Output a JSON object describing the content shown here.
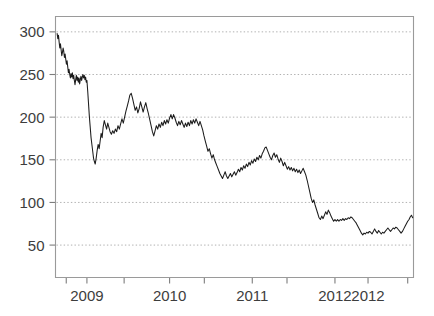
{
  "chart_data": {
    "type": "line",
    "title": "",
    "subtitle": "",
    "xlabel": "",
    "ylabel": "",
    "xlim": [
      2008.62,
      2012.95
    ],
    "ylim": [
      12,
      318
    ],
    "grid": true,
    "grid_axis": "y",
    "legend": null,
    "legend_position": "none",
    "line_color": "#1c1c1c",
    "grid_color": "#a8a8a8",
    "axis_color": "#8e8e8e",
    "label_color": "#3d3d3d",
    "background_color": "#ffffff",
    "ytick_values": [
      50,
      100,
      150,
      200,
      250,
      300
    ],
    "ytick_labels": [
      "50",
      "100",
      "150",
      "200",
      "250",
      "300"
    ],
    "xtick_values": [
      2008.75,
      2009.0,
      2009.45,
      2010.0,
      2010.42,
      2011.0,
      2011.42,
      2012.0,
      2012.4,
      2012.88
    ],
    "xtick_labeled": [
      2009.0,
      2010.0,
      2011.0,
      2012.0,
      2012.4
    ],
    "xtick_labels": [
      "2009",
      "2010",
      "2011",
      "2012",
      "2012"
    ],
    "series": [
      {
        "name": "price",
        "color": "#1c1c1c",
        "x": [
          2008.64,
          2008.648,
          2008.656,
          2008.664,
          2008.672,
          2008.68,
          2008.688,
          2008.696,
          2008.704,
          2008.712,
          2008.72,
          2008.728,
          2008.736,
          2008.744,
          2008.752,
          2008.76,
          2008.768,
          2008.776,
          2008.784,
          2008.792,
          2008.8,
          2008.808,
          2008.816,
          2008.824,
          2008.832,
          2008.84,
          2008.848,
          2008.856,
          2008.864,
          2008.872,
          2008.88,
          2008.888,
          2008.896,
          2008.904,
          2008.912,
          2008.92,
          2008.928,
          2008.936,
          2008.944,
          2008.952,
          2008.96,
          2008.968,
          2008.976,
          2008.984,
          2008.992,
          2009.0,
          2009.01,
          2009.02,
          2009.03,
          2009.04,
          2009.05,
          2009.06,
          2009.07,
          2009.08,
          2009.09,
          2009.1,
          2009.112,
          2009.124,
          2009.136,
          2009.148,
          2009.16,
          2009.172,
          2009.184,
          2009.196,
          2009.21,
          2009.224,
          2009.238,
          2009.252,
          2009.266,
          2009.28,
          2009.296,
          2009.312,
          2009.328,
          2009.344,
          2009.36,
          2009.376,
          2009.392,
          2009.408,
          2009.424,
          2009.44,
          2009.456,
          2009.472,
          2009.488,
          2009.504,
          2009.52,
          2009.536,
          2009.552,
          2009.568,
          2009.584,
          2009.6,
          2009.616,
          2009.632,
          2009.648,
          2009.664,
          2009.68,
          2009.696,
          2009.712,
          2009.728,
          2009.744,
          2009.76,
          2009.776,
          2009.792,
          2009.808,
          2009.824,
          2009.84,
          2009.856,
          2009.872,
          2009.888,
          2009.904,
          2009.92,
          2009.936,
          2009.952,
          2009.968,
          2009.984,
          2010.0,
          2010.016,
          2010.032,
          2010.048,
          2010.064,
          2010.08,
          2010.096,
          2010.112,
          2010.128,
          2010.144,
          2010.16,
          2010.176,
          2010.192,
          2010.208,
          2010.224,
          2010.24,
          2010.256,
          2010.272,
          2010.288,
          2010.304,
          2010.32,
          2010.336,
          2010.352,
          2010.368,
          2010.384,
          2010.4,
          2010.416,
          2010.432,
          2010.448,
          2010.464,
          2010.48,
          2010.496,
          2010.512,
          2010.528,
          2010.544,
          2010.56,
          2010.576,
          2010.592,
          2010.608,
          2010.624,
          2010.64,
          2010.656,
          2010.672,
          2010.688,
          2010.704,
          2010.72,
          2010.736,
          2010.752,
          2010.768,
          2010.784,
          2010.8,
          2010.816,
          2010.832,
          2010.848,
          2010.864,
          2010.88,
          2010.896,
          2010.912,
          2010.928,
          2010.944,
          2010.96,
          2010.976,
          2010.992,
          2011.008,
          2011.024,
          2011.04,
          2011.056,
          2011.072,
          2011.088,
          2011.104,
          2011.12,
          2011.136,
          2011.152,
          2011.168,
          2011.184,
          2011.2,
          2011.216,
          2011.232,
          2011.248,
          2011.264,
          2011.28,
          2011.296,
          2011.312,
          2011.328,
          2011.344,
          2011.36,
          2011.376,
          2011.392,
          2011.408,
          2011.424,
          2011.44,
          2011.456,
          2011.472,
          2011.488,
          2011.504,
          2011.52,
          2011.536,
          2011.552,
          2011.568,
          2011.584,
          2011.6,
          2011.616,
          2011.632,
          2011.648,
          2011.664,
          2011.68,
          2011.696,
          2011.712,
          2011.728,
          2011.744,
          2011.76,
          2011.776,
          2011.792,
          2011.808,
          2011.824,
          2011.84,
          2011.856,
          2011.872,
          2011.888,
          2011.904,
          2011.92,
          2011.936,
          2011.952,
          2011.968,
          2011.984,
          2012.0,
          2012.016,
          2012.032,
          2012.048,
          2012.064,
          2012.08,
          2012.096,
          2012.112,
          2012.128,
          2012.144,
          2012.16,
          2012.176,
          2012.192,
          2012.208,
          2012.224,
          2012.24,
          2012.256,
          2012.272,
          2012.288,
          2012.304,
          2012.32,
          2012.336,
          2012.352,
          2012.368,
          2012.384,
          2012.4,
          2012.416,
          2012.432,
          2012.448,
          2012.464,
          2012.48,
          2012.496,
          2012.512,
          2012.528,
          2012.544,
          2012.56,
          2012.576,
          2012.592,
          2012.608,
          2012.624,
          2012.64,
          2012.656,
          2012.672,
          2012.688,
          2012.704,
          2012.72,
          2012.736,
          2012.752,
          2012.768,
          2012.784,
          2012.8,
          2012.816,
          2012.832,
          2012.848,
          2012.864,
          2012.88,
          2012.896,
          2012.91,
          2012.925,
          2012.94
        ],
        "y": [
          298,
          292,
          296,
          288,
          281,
          286,
          279,
          272,
          276,
          281,
          277,
          270,
          274,
          268,
          262,
          266,
          259,
          252,
          256,
          250,
          246,
          251,
          247,
          252,
          245,
          249,
          243,
          238,
          244,
          249,
          243,
          247,
          241,
          246,
          239,
          244,
          248,
          243,
          247,
          250,
          246,
          249,
          244,
          247,
          241,
          243,
          230,
          215,
          200,
          188,
          176,
          168,
          160,
          152,
          148,
          145,
          152,
          161,
          168,
          163,
          172,
          181,
          176,
          188,
          196,
          191,
          186,
          193,
          188,
          183,
          180,
          184,
          181,
          186,
          183,
          190,
          186,
          192,
          198,
          193,
          200,
          207,
          213,
          219,
          226,
          228,
          222,
          215,
          208,
          212,
          205,
          210,
          218,
          212,
          206,
          212,
          217,
          210,
          204,
          197,
          190,
          183,
          178,
          184,
          190,
          186,
          192,
          188,
          194,
          190,
          196,
          192,
          197,
          193,
          199,
          203,
          198,
          203,
          199,
          194,
          190,
          195,
          191,
          196,
          192,
          188,
          193,
          189,
          194,
          190,
          196,
          192,
          197,
          193,
          198,
          194,
          190,
          195,
          190,
          185,
          178,
          172,
          166,
          160,
          163,
          157,
          152,
          156,
          150,
          146,
          142,
          138,
          134,
          131,
          128,
          132,
          136,
          131,
          128,
          131,
          134,
          130,
          133,
          136,
          132,
          135,
          139,
          136,
          141,
          138,
          143,
          140,
          145,
          142,
          147,
          144,
          149,
          146,
          151,
          148,
          153,
          150,
          155,
          152,
          157,
          160,
          164,
          165,
          161,
          157,
          153,
          150,
          155,
          158,
          153,
          156,
          151,
          147,
          152,
          148,
          143,
          147,
          143,
          139,
          142,
          138,
          141,
          137,
          140,
          136,
          139,
          135,
          138,
          134,
          137,
          140,
          136,
          132,
          126,
          119,
          112,
          105,
          100,
          103,
          97,
          92,
          87,
          82,
          80,
          84,
          81,
          85,
          89,
          86,
          91,
          88,
          84,
          81,
          78,
          80,
          78,
          80,
          78,
          80,
          79,
          81,
          79,
          81,
          80,
          82,
          81,
          83,
          82,
          80,
          78,
          76,
          73,
          70,
          67,
          64,
          62,
          64,
          63,
          65,
          64,
          66,
          65,
          63,
          66,
          69,
          66,
          64,
          67,
          65,
          63,
          65,
          64,
          66,
          68,
          70,
          68,
          66,
          68,
          70,
          69,
          71,
          70,
          68,
          66,
          64,
          66,
          69,
          72,
          75,
          78,
          80,
          83,
          85,
          82
        ]
      }
    ]
  }
}
